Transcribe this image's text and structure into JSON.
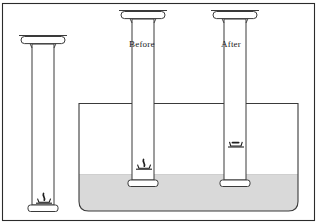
{
  "figure": {
    "name": "column-settlement-diagram",
    "title": "",
    "labels": {
      "before": "Before",
      "after": "After"
    },
    "colors": {
      "outline": "#3a3a3a",
      "frame": "#2b2b2b",
      "fill": "#ffffff",
      "sediment": "#d9d9d9",
      "sediment_edge": "#c9c9c9",
      "symbol": "#1f1f1f",
      "text": "#1a1a1a",
      "background": "#ffffff"
    },
    "frame": {
      "x": 2,
      "y": 3,
      "width": 313,
      "height": 218
    },
    "tank": {
      "name": "fluid-tank",
      "left": 79,
      "right": 298,
      "top": 103,
      "bottom": 211,
      "corner_radius": 9,
      "sediment_level_y": 174
    },
    "columns": [
      {
        "name": "column-left-dry",
        "label": "",
        "center_x": 43,
        "capital_top_y": 35,
        "base_bottom_y": 212,
        "shaft_half_width": 11,
        "capital_half_width": 20,
        "symbol": {
          "type": "anchor-hook",
          "center_y": 201,
          "compressed": false
        }
      },
      {
        "name": "column-before",
        "label": "Before",
        "center_x": 143,
        "capital_top_y": 10,
        "base_bottom_y": 187,
        "shaft_half_width": 11,
        "capital_half_width": 20,
        "symbol": {
          "type": "anchor-hook",
          "center_y": 167,
          "compressed": false
        }
      },
      {
        "name": "column-after",
        "label": "After",
        "center_x": 235,
        "capital_top_y": 10,
        "base_bottom_y": 187,
        "shaft_half_width": 11,
        "capital_half_width": 20,
        "symbol": {
          "type": "anchor-hook-compressed",
          "center_y": 145,
          "compressed": true
        }
      }
    ]
  }
}
